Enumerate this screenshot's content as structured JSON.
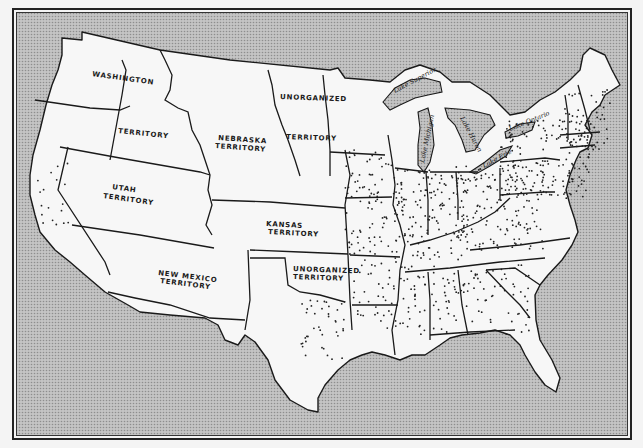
{
  "map": {
    "colors": {
      "water": "#b9b9b9",
      "land": "#f7f7f7",
      "ink": "#1a1a1a"
    },
    "territory_labels": [
      {
        "id": "washington",
        "text": "WASHINGTON",
        "x": 92,
        "y": 76,
        "rotate": 8
      },
      {
        "id": "washington-2",
        "text": "TERRITORY",
        "x": 118,
        "y": 133,
        "rotate": 6
      },
      {
        "id": "nebraska",
        "text": "NEBRASKA",
        "x": 218,
        "y": 140,
        "rotate": 4
      },
      {
        "id": "nebraska-2",
        "text": "TERRITORY",
        "x": 215,
        "y": 148,
        "rotate": 4
      },
      {
        "id": "unorganized-north",
        "text": "UNORGANIZED",
        "x": 280,
        "y": 99,
        "rotate": 2
      },
      {
        "id": "unorganized-north-2",
        "text": "TERRITORY",
        "x": 286,
        "y": 139,
        "rotate": 2
      },
      {
        "id": "utah",
        "text": "UTAH",
        "x": 112,
        "y": 189,
        "rotate": 8
      },
      {
        "id": "utah-2",
        "text": "TERRITORY",
        "x": 103,
        "y": 198,
        "rotate": 8
      },
      {
        "id": "kansas",
        "text": "KANSAS",
        "x": 266,
        "y": 226,
        "rotate": 3
      },
      {
        "id": "kansas-2",
        "text": "TERRITORY",
        "x": 268,
        "y": 234,
        "rotate": 3
      },
      {
        "id": "new-mexico",
        "text": "NEW MEXICO",
        "x": 158,
        "y": 275,
        "rotate": 7
      },
      {
        "id": "new-mexico-2",
        "text": "TERRITORY",
        "x": 160,
        "y": 283,
        "rotate": 7
      },
      {
        "id": "unorganized-south",
        "text": "UNORGANIZED",
        "x": 293,
        "y": 271,
        "rotate": 2
      },
      {
        "id": "unorganized-south-2",
        "text": "TERRITORY",
        "x": 293,
        "y": 279,
        "rotate": 2
      }
    ],
    "lake_labels": [
      {
        "id": "lake-superior",
        "text": "Lake Superior",
        "x": 395,
        "y": 93,
        "rotate": -28
      },
      {
        "id": "lake-michigan",
        "text": "Lake Michigan",
        "x": 424,
        "y": 163,
        "rotate": -78
      },
      {
        "id": "lake-huron",
        "text": "Lake Huron",
        "x": 460,
        "y": 118,
        "rotate": 62
      },
      {
        "id": "lake-erie",
        "text": "Lake Erie",
        "x": 484,
        "y": 168,
        "rotate": -28
      },
      {
        "id": "lake-ontario",
        "text": "Lake Ontario",
        "x": 510,
        "y": 131,
        "rotate": -22
      }
    ]
  }
}
